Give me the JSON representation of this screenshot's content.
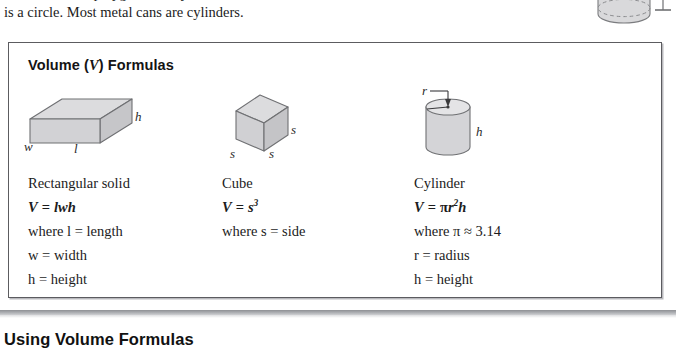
{
  "page": {
    "intro_paragraph": {
      "clipped_line": "of the base is a polygon. In a cylinder the base",
      "line": "is a circle. Most metal cans are cylinders."
    },
    "top_figure": {
      "icon": "cylinder-icon",
      "dimension_marker": "height-dimension-line"
    },
    "formula_box": {
      "title_prefix": "Volume (",
      "title_variable": "V",
      "title_suffix": ") Formulas",
      "columns": [
        {
          "id": "rectangular-solid",
          "figure_icon": "rectangular-solid-icon",
          "figure_labels": [
            "h",
            "l",
            "w"
          ],
          "name": "Rectangular solid",
          "formula_lhs": "V",
          "formula_eq": "=",
          "formula_rhs": "lwh",
          "definitions": [
            "where l  =  length",
            "w  =  width",
            "h  =  height"
          ]
        },
        {
          "id": "cube",
          "figure_icon": "cube-icon",
          "figure_labels": [
            "s",
            "s",
            "s"
          ],
          "name": "Cube",
          "formula_lhs": "V",
          "formula_eq": "=",
          "formula_rhs": "s",
          "formula_exponent": "3",
          "definitions": [
            "where s  =  side"
          ]
        },
        {
          "id": "cylinder",
          "figure_icon": "cylinder-icon",
          "figure_labels": [
            "r",
            "h"
          ],
          "name": "Cylinder",
          "formula_lhs": "V",
          "formula_eq": "=",
          "formula_rhs_pi": "π",
          "formula_rhs_r": "r",
          "formula_exponent": "2",
          "formula_rhs_h": "h",
          "definitions": [
            "where π  ≈  3.14",
            "r  =  radius",
            "h  =  height"
          ]
        }
      ]
    },
    "section": {
      "heading": "Using Volume Formulas"
    },
    "colors": {
      "box_border": "#5c5c60",
      "figure_fill": "#d4d4d6",
      "figure_fill_light": "#e2e2e4",
      "figure_stroke": "#6f7073",
      "rule": "#9a9ca0",
      "text": "#1c1c1c"
    }
  }
}
